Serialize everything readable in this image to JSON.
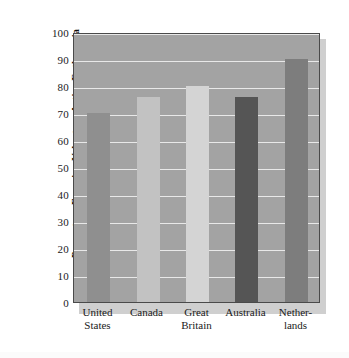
{
  "chart_data": {
    "type": "bar",
    "title": "",
    "subtitle": "",
    "xlabel": "",
    "ylabel": "Percentage Favoring Voluntary Active Euthanasia",
    "ylim": [
      0,
      100
    ],
    "yticks": [
      0,
      10,
      20,
      30,
      40,
      50,
      60,
      70,
      80,
      90,
      100
    ],
    "ytick_labels": [
      "0",
      "10",
      "20",
      "30",
      "40",
      "50",
      "60",
      "70",
      "80",
      "90",
      "100"
    ],
    "grid": true,
    "grid_color": "#e8e8e8",
    "legend": null,
    "legend_position": "none",
    "plot_background": "#a3a3a3",
    "categories": [
      "United States",
      "Canada",
      "Great Britain",
      "Australia",
      "Netherlands"
    ],
    "category_lines": [
      [
        "United",
        "States"
      ],
      [
        "Canada"
      ],
      [
        "Great",
        "Britain"
      ],
      [
        "Australia"
      ],
      [
        "Nether-",
        "lands"
      ]
    ],
    "values": [
      70,
      76,
      80,
      76,
      90
    ],
    "bar_colors": [
      "#8f8f8f",
      "#c2c2c2",
      "#d4d4d4",
      "#555555",
      "#7d7d7d"
    ],
    "bars": [
      {
        "category": "United States",
        "value": 70,
        "color": "#8f8f8f"
      },
      {
        "category": "Canada",
        "value": 76,
        "color": "#c2c2c2"
      },
      {
        "category": "Great Britain",
        "value": 80,
        "color": "#d4d4d4"
      },
      {
        "category": "Australia",
        "value": 76,
        "color": "#555555"
      },
      {
        "category": "Netherlands",
        "value": 90,
        "color": "#7d7d7d"
      }
    ]
  }
}
